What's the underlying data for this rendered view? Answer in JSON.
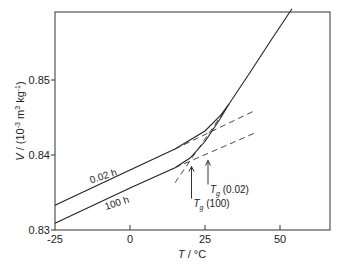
{
  "chart_data": {
    "type": "line",
    "title": "",
    "xlabel": "T / °C",
    "ylabel": "V / (10^-3 m^3 kg^-1)",
    "xlim": [
      -25,
      67
    ],
    "ylim": [
      0.83,
      0.8597
    ],
    "xticks": [
      -25,
      0,
      25,
      50
    ],
    "xtick_labels": [
      "-25",
      "0",
      "25",
      "50"
    ],
    "yticks": [
      0.83,
      0.84,
      0.85
    ],
    "ytick_labels": [
      "0.83",
      "0.84",
      "0.85"
    ],
    "grid": false,
    "series": [
      {
        "name": "0.02 h",
        "label": "0.02 h",
        "points": [
          [
            -25,
            0.8333
          ],
          [
            0,
            0.838
          ],
          [
            15,
            0.8408
          ],
          [
            25,
            0.8432
          ],
          [
            30,
            0.8452
          ],
          [
            33,
            0.8468
          ],
          [
            40,
            0.851
          ],
          [
            47,
            0.8553
          ],
          [
            54,
            0.8595
          ]
        ]
      },
      {
        "name": "100 h",
        "label": "100 h",
        "points": [
          [
            -25,
            0.8309
          ],
          [
            0,
            0.8356
          ],
          [
            15,
            0.8383
          ],
          [
            20,
            0.8396
          ],
          [
            25,
            0.8418
          ],
          [
            30,
            0.8448
          ],
          [
            33,
            0.8468
          ]
        ]
      },
      {
        "name": "glass extrapolation 0.02 h",
        "style": "dashed",
        "points": [
          [
            15,
            0.8408
          ],
          [
            42,
            0.846
          ]
        ]
      },
      {
        "name": "glass extrapolation 100 h",
        "style": "dashed",
        "points": [
          [
            15,
            0.8383
          ],
          [
            42,
            0.843
          ]
        ]
      },
      {
        "name": "rubber extrapolation",
        "style": "dashed",
        "points": [
          [
            15,
            0.8363
          ],
          [
            33,
            0.8468
          ]
        ]
      }
    ],
    "annotations": [
      {
        "text": "Tg (0.02)",
        "main": "T",
        "sub": "g",
        "rest": " (0.02)",
        "x": 26,
        "y": 0.8398
      },
      {
        "text": "Tg (100)",
        "main": "T",
        "sub": "g",
        "rest": " (100)",
        "x": 20.5,
        "y": 0.839
      }
    ]
  }
}
